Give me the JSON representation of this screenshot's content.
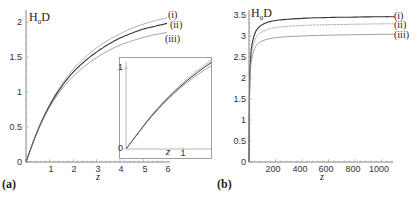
{
  "chart_data": [
    {
      "panel": "(a)",
      "type": "line",
      "title": "",
      "xlabel": "z",
      "ylabel": "H0D",
      "xlim": [
        0,
        6
      ],
      "ylim": [
        0,
        2
      ],
      "x_ticks": [
        "1",
        "2",
        "3",
        "4",
        "5",
        "6"
      ],
      "y_ticks": [
        "0",
        "0.5",
        "1",
        "1.5",
        "2"
      ],
      "grid": false,
      "legend": [
        "(i)",
        "(ii)",
        "(iii)"
      ],
      "x": [
        0,
        0.5,
        1,
        1.5,
        2,
        2.5,
        3,
        3.5,
        4,
        4.5,
        5,
        5.5,
        6
      ],
      "series": [
        {
          "name": "(i)",
          "values": [
            0,
            0.46,
            0.82,
            1.1,
            1.32,
            1.49,
            1.63,
            1.74,
            1.83,
            1.91,
            1.97,
            2.02,
            2.06
          ]
        },
        {
          "name": "(ii)",
          "values": [
            0,
            0.45,
            0.8,
            1.07,
            1.28,
            1.44,
            1.57,
            1.68,
            1.77,
            1.84,
            1.9,
            1.94,
            1.98
          ]
        },
        {
          "name": "(iii)",
          "values": [
            0,
            0.44,
            0.78,
            1.03,
            1.22,
            1.37,
            1.49,
            1.59,
            1.67,
            1.73,
            1.78,
            1.82,
            1.85
          ]
        }
      ],
      "inset": {
        "xlim": [
          0,
          1.5
        ],
        "ylim": [
          0,
          1.1
        ],
        "x_ticks": [
          "1"
        ],
        "y_ticks": [
          "0",
          "1"
        ],
        "xlabel": "z"
      }
    },
    {
      "panel": "(b)",
      "type": "line",
      "title": "",
      "xlabel": "z",
      "ylabel": "H0D",
      "xlim": [
        0,
        1100
      ],
      "ylim": [
        0,
        3.5
      ],
      "x_ticks": [
        "200",
        "400",
        "600",
        "800",
        "1000"
      ],
      "y_ticks": [
        "0",
        "0.5",
        "1",
        "1.5",
        "2",
        "2.5",
        "3",
        "3.5"
      ],
      "grid": false,
      "legend": [
        "(i)",
        "(ii)",
        "(iii)"
      ],
      "x": [
        0,
        5,
        10,
        20,
        50,
        100,
        200,
        400,
        600,
        800,
        1000,
        1100
      ],
      "series": [
        {
          "name": "(i)",
          "values": [
            0,
            1.9,
            2.35,
            2.75,
            3.1,
            3.27,
            3.37,
            3.42,
            3.44,
            3.45,
            3.46,
            3.46
          ]
        },
        {
          "name": "(ii)",
          "values": [
            0,
            1.85,
            2.25,
            2.6,
            2.95,
            3.1,
            3.2,
            3.25,
            3.27,
            3.28,
            3.29,
            3.29
          ]
        },
        {
          "name": "(iii)",
          "values": [
            0,
            1.8,
            2.15,
            2.45,
            2.75,
            2.88,
            2.96,
            3.0,
            3.02,
            3.03,
            3.04,
            3.04
          ]
        }
      ]
    }
  ],
  "labels": {
    "a": {
      "panel": "(a)",
      "ylabel_main": "H",
      "ylabel_sub": "0",
      "ylabel_tail": "D",
      "xlabel": "z",
      "x_ticks": [
        "1",
        "2",
        "3",
        "4",
        "5",
        "6"
      ],
      "y_ticks": [
        "0",
        "0.5",
        "1",
        "1.5",
        "2"
      ],
      "legend": [
        "(i)",
        "(ii)",
        "(iii)"
      ],
      "inset_x_tick": "1",
      "inset_y_tick_top": "1",
      "inset_y_tick_zero": "0",
      "inset_xlabel": "z"
    },
    "b": {
      "panel": "(b)",
      "ylabel_main": "H",
      "ylabel_sub": "0",
      "ylabel_tail": "D",
      "xlabel": "z",
      "x_ticks": [
        "200",
        "400",
        "600",
        "800",
        "1000"
      ],
      "y_ticks": [
        "0",
        "0.5",
        "1",
        "1.5",
        "2",
        "2.5",
        "3",
        "3.5"
      ],
      "legend": [
        "(i)",
        "(ii)",
        "(iii)"
      ]
    }
  }
}
